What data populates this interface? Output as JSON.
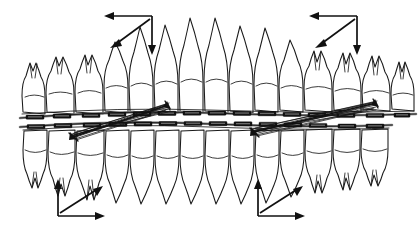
{
  "figure": {
    "name": "orthodontic-occlusion-force-diagram",
    "title": "",
    "caption": "",
    "background_color": "#ffffff",
    "line_color": "#1a1a1a",
    "bracket_color": "#141414",
    "wire_color": "#262626",
    "width": 418,
    "height": 233
  },
  "arches": {
    "upper": {
      "label": "upper-dental-arch",
      "root_direction": "up",
      "tooth_count": 14,
      "archwire_y": 112,
      "occlusal_curve": "gentle convex-down arc across arch"
    },
    "lower": {
      "label": "lower-dental-arch",
      "root_direction": "down",
      "tooth_count": 14,
      "archwire_y": 128,
      "occlusal_curve": "gentle convex-up arc across arch"
    }
  },
  "appliance": {
    "brackets_label": "bracket",
    "archwire_label": "archwire",
    "elastic_label": "elastic-traction-bundle",
    "bundles": [
      {
        "name": "left-elastic-bundle",
        "from_x": 72,
        "from_y": 136,
        "to_x": 168,
        "to_y": 104,
        "strand_count": 7,
        "direction": "lower-anterior to upper-posterior"
      },
      {
        "name": "right-elastic-bundle",
        "from_x": 253,
        "from_y": 131,
        "to_x": 376,
        "to_y": 102,
        "strand_count": 7,
        "direction": "lower-anterior to upper-posterior"
      }
    ]
  },
  "force_indicators": [
    {
      "name": "force-triad-top-left",
      "origin_x": 152,
      "origin_y": 16,
      "arrows": [
        {
          "name": "horizontal-arrow-left",
          "dir": "left",
          "dx": -45,
          "dy": 0
        },
        {
          "name": "vertical-arrow-down",
          "dir": "down",
          "dx": 0,
          "dy": 37
        },
        {
          "name": "diagonal-arrow-down-left",
          "dir": "down-left",
          "dx": -44,
          "dy": 32
        }
      ]
    },
    {
      "name": "force-triad-top-right",
      "origin_x": 357,
      "origin_y": 16,
      "arrows": [
        {
          "name": "horizontal-arrow-left",
          "dir": "left",
          "dx": -45,
          "dy": 0
        },
        {
          "name": "vertical-arrow-down",
          "dir": "down",
          "dx": 0,
          "dy": 37
        },
        {
          "name": "diagonal-arrow-down-left",
          "dir": "down-left",
          "dx": -44,
          "dy": 32
        }
      ]
    },
    {
      "name": "force-triad-bottom-left",
      "origin_x": 58,
      "origin_y": 216,
      "arrows": [
        {
          "name": "vertical-arrow-up",
          "dir": "up",
          "dx": 0,
          "dy": -37
        },
        {
          "name": "horizontal-arrow-right",
          "dir": "right",
          "dx": 45,
          "dy": 0
        },
        {
          "name": "diagonal-arrow-up-right",
          "dir": "up-right",
          "dx": 44,
          "dy": -32
        }
      ]
    },
    {
      "name": "force-triad-bottom-right",
      "origin_x": 258,
      "origin_y": 216,
      "arrows": [
        {
          "name": "vertical-arrow-up",
          "dir": "up",
          "dx": 0,
          "dy": -37
        },
        {
          "name": "horizontal-arrow-right",
          "dir": "right",
          "dx": 45,
          "dy": 0
        },
        {
          "name": "diagonal-arrow-up-right",
          "dir": "up-right",
          "dx": 44,
          "dy": -32
        }
      ]
    }
  ]
}
